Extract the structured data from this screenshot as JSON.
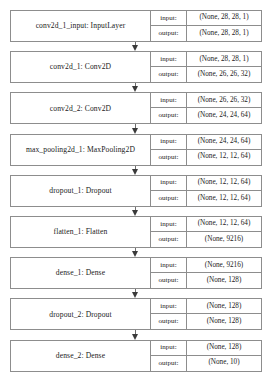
{
  "diagram": {
    "type": "keras-model-plot",
    "colors": {
      "border": "#8d8d8d",
      "text": "#1a1a1a",
      "arrow": "#3a3a3a",
      "background": "#ffffff"
    },
    "row_keys": {
      "input": "input:",
      "output": "output:"
    },
    "layers": [
      {
        "label": "conv2d_1_input: InputLayer",
        "name": "conv2d_1_input",
        "type": "InputLayer",
        "input_shape": "(None, 28, 28, 1)",
        "output_shape": "(None, 28, 28, 1)"
      },
      {
        "label": "conv2d_1: Conv2D",
        "name": "conv2d_1",
        "type": "Conv2D",
        "input_shape": "(None, 28, 28, 1)",
        "output_shape": "(None, 26, 26, 32)"
      },
      {
        "label": "conv2d_2: Conv2D",
        "name": "conv2d_2",
        "type": "Conv2D",
        "input_shape": "(None, 26, 26, 32)",
        "output_shape": "(None, 24, 24, 64)"
      },
      {
        "label": "max_pooling2d_1: MaxPooling2D",
        "name": "max_pooling2d_1",
        "type": "MaxPooling2D",
        "input_shape": "(None, 24, 24, 64)",
        "output_shape": "(None, 12, 12, 64)"
      },
      {
        "label": "dropout_1: Dropout",
        "name": "dropout_1",
        "type": "Dropout",
        "input_shape": "(None, 12, 12, 64)",
        "output_shape": "(None, 12, 12, 64)"
      },
      {
        "label": "flatten_1: Flatten",
        "name": "flatten_1",
        "type": "Flatten",
        "input_shape": "(None, 12, 12, 64)",
        "output_shape": "(None, 9216)"
      },
      {
        "label": "dense_1: Dense",
        "name": "dense_1",
        "type": "Dense",
        "input_shape": "(None, 9216)",
        "output_shape": "(None, 128)"
      },
      {
        "label": "dropout_2: Dropout",
        "name": "dropout_2",
        "type": "Dropout",
        "input_shape": "(None, 128)",
        "output_shape": "(None, 128)"
      },
      {
        "label": "dense_2: Dense",
        "name": "dense_2",
        "type": "Dense",
        "input_shape": "(None, 128)",
        "output_shape": "(None, 10)"
      }
    ],
    "connections": [
      {
        "from": "conv2d_1_input",
        "to": "conv2d_1"
      },
      {
        "from": "conv2d_1",
        "to": "conv2d_2"
      },
      {
        "from": "conv2d_2",
        "to": "max_pooling2d_1"
      },
      {
        "from": "max_pooling2d_1",
        "to": "dropout_1"
      },
      {
        "from": "dropout_1",
        "to": "flatten_1"
      },
      {
        "from": "flatten_1",
        "to": "dense_1"
      },
      {
        "from": "dense_1",
        "to": "dropout_2"
      },
      {
        "from": "dropout_2",
        "to": "dense_2"
      }
    ]
  }
}
